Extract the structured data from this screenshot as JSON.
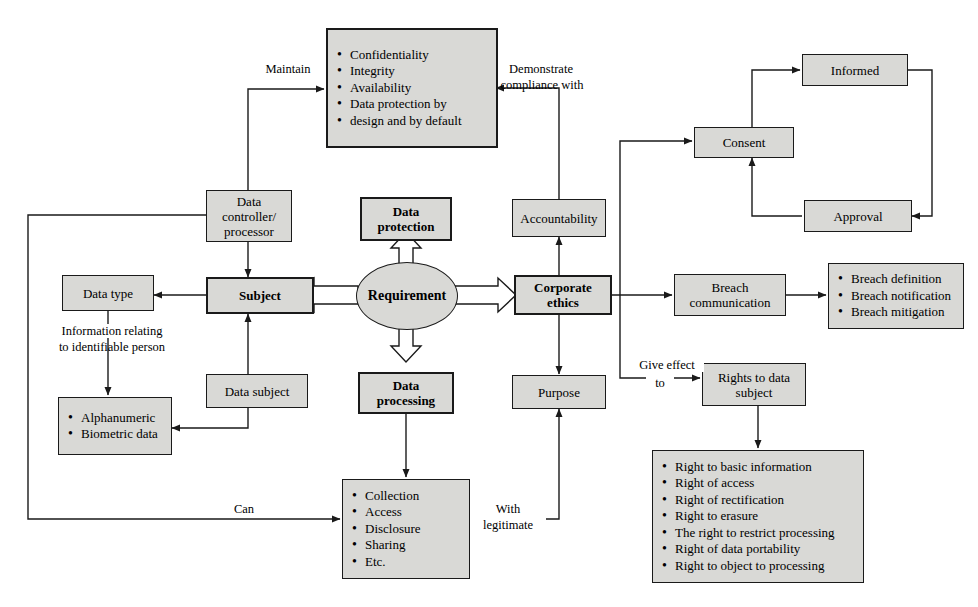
{
  "diagram": {
    "style": {
      "box_fill": "#d9d9d6",
      "box_stroke": "#1a1a1a",
      "background": "#ffffff",
      "line_color": "#1a1a1a"
    },
    "nodes": {
      "requirement": {
        "label": "Requirement",
        "shape": "ellipse"
      },
      "data_protection": {
        "label": "Data protection",
        "line1": "Data",
        "line2": "protection"
      },
      "data_processing": {
        "label": "Data processing",
        "line1": "Data",
        "line2": "processing"
      },
      "subject": {
        "label": "Subject"
      },
      "corporate_ethics": {
        "label": "Corporate ethics",
        "line1": "Corporate",
        "line2": "ethics"
      },
      "cia_list": {
        "items": [
          "Confidentiality",
          "Integrity",
          "Availability",
          "Data protection by",
          "design and by default"
        ]
      },
      "data_controller": {
        "label": "Data controller/ processor",
        "line1": "Data controller/",
        "line2": "processor"
      },
      "accountability": {
        "label": "Accountability"
      },
      "data_type": {
        "label": "Data type"
      },
      "data_subject": {
        "label": "Data subject"
      },
      "identifiers": {
        "items": [
          "Alphanumeric",
          "Biometric data"
        ]
      },
      "purpose": {
        "label": "Purpose"
      },
      "processing_ops": {
        "items": [
          "Collection",
          "Access",
          "Disclosure",
          "Sharing",
          "Etc."
        ]
      },
      "consent": {
        "label": "Consent"
      },
      "informed": {
        "label": "Informed"
      },
      "approval": {
        "label": "Approval"
      },
      "breach_communication": {
        "label": "Breach communication",
        "line1": "Breach",
        "line2": "communication"
      },
      "breach_list": {
        "items": [
          "Breach definition",
          "Breach notification",
          "Breach mitigation"
        ]
      },
      "rights_to_data_subject": {
        "label": "Rights to data subject",
        "line1": "Rights to data",
        "line2": "subject"
      },
      "rights_list": {
        "items": [
          "Right to basic information",
          "Right of access",
          "Right of rectification",
          "Right to erasure",
          "The right to restrict processing",
          "Right of data portability",
          "Right to object to processing"
        ]
      }
    },
    "edge_labels": {
      "maintain": "Maintain",
      "demonstrate_line1": "Demonstrate",
      "demonstrate_line2": "compliance  with",
      "info_relating_line1": "Information relating",
      "info_relating_line2": "to identifiable person",
      "can": "Can",
      "with_legitimate_line1": "With",
      "with_legitimate_line2": "legitimate",
      "give_effect_line1": "Give effect",
      "give_effect_line2": "to"
    }
  }
}
